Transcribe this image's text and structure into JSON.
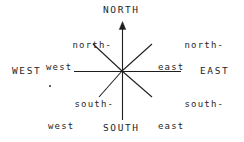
{
  "figure": {
    "kind": "compass-rose-diagram",
    "width": 244,
    "height": 142,
    "background_color": "#ffffff",
    "ink_color": "#1d1d1d"
  },
  "cardinal_labels": {
    "north": "NORTH",
    "south": "SOUTH",
    "west": "WEST",
    "east": "EAST"
  },
  "intercardinal_labels": {
    "northwest": {
      "line1": "north-",
      "line2": "west"
    },
    "northeast": {
      "line1": "north-",
      "line2": "east"
    },
    "southwest": {
      "line1": "south-",
      "line2": "west"
    },
    "southeast": {
      "line1": "south-",
      "line2": "east"
    }
  },
  "geometry": {
    "center": {
      "x": 122,
      "y": 71
    },
    "vertical_axis": {
      "x": 122,
      "top_y": 22,
      "bottom_y": 120,
      "arrowhead": "north"
    },
    "horizontal_axis": {
      "y": 71,
      "left_x": 74,
      "right_x": 181,
      "arrowhead": "none"
    },
    "diagonals": [
      {
        "name": "northwest",
        "x1": 122,
        "y1": 71,
        "x2": 93,
        "y2": 44
      },
      {
        "name": "northeast",
        "x1": 122,
        "y1": 71,
        "x2": 152,
        "y2": 44
      },
      {
        "name": "southwest",
        "x1": 122,
        "y1": 71,
        "x2": 99,
        "y2": 97
      },
      {
        "name": "southeast",
        "x1": 122,
        "y1": 71,
        "x2": 152,
        "y2": 97
      }
    ],
    "stroke_width": 1.1
  },
  "artifacts": {
    "southwest_speck": "scan-speck"
  }
}
